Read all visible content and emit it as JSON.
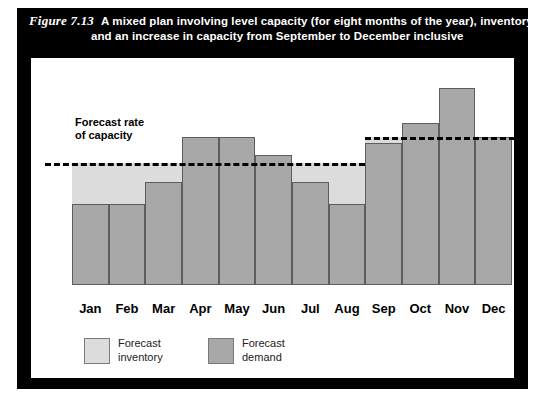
{
  "figure": {
    "number": "Figure 7.13",
    "title_line1": "A mixed plan involving level capacity (for eight months of the year), inventory",
    "title_line2": "and an increase in capacity from September to December inclusive"
  },
  "annotation": {
    "line1": "Forecast rate",
    "line2": "of capacity"
  },
  "legend": {
    "items": [
      {
        "label_line1": "Forecast",
        "label_line2": "inventory",
        "color": "#dcdcdc"
      },
      {
        "label_line1": "Forecast",
        "label_line2": "demand",
        "color": "#a8a8a8"
      }
    ]
  },
  "colors": {
    "demand": "#a8a8a8",
    "inventory": "#dcdcdc",
    "bar_border": "#5d5d5d",
    "frame": "#000000",
    "panel": "#ffffff",
    "capacity_line": "#000000"
  },
  "chart_data": {
    "type": "bar",
    "title": "A mixed plan involving level capacity (for eight months of the year), inventory and an increase in capacity from September to December inclusive",
    "xlabel": "",
    "ylabel": "",
    "grid": false,
    "legend_position": "bottom-left",
    "categories": [
      "Jan",
      "Feb",
      "Mar",
      "Apr",
      "May",
      "Jun",
      "Jul",
      "Aug",
      "Sep",
      "Oct",
      "Nov",
      "Dec"
    ],
    "series": [
      {
        "name": "Forecast demand",
        "color": "#a8a8a8",
        "values": [
          41,
          41,
          52,
          75,
          75,
          66,
          52,
          41,
          72,
          82,
          100,
          75
        ]
      }
    ],
    "capacity_line": {
      "name": "Forecast rate of capacity",
      "style": "dashed",
      "segments": [
        {
          "from": "Jan",
          "to": "Aug",
          "value": 62
        },
        {
          "from": "Sep",
          "to": "Dec",
          "value": 75
        }
      ]
    },
    "inventory_band": {
      "name": "Forecast inventory",
      "color": "#dcdcdc",
      "description": "Light shaded area between forecast demand bars and the forecast rate of capacity where demand is below capacity"
    },
    "ylim": [
      0,
      110
    ]
  }
}
